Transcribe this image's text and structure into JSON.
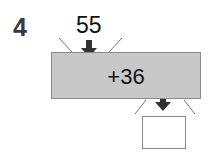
{
  "problem": {
    "number": "4",
    "input_value": "55",
    "operation": "+36",
    "answer": ""
  },
  "colors": {
    "box_fill": "#c8c8c8",
    "box_border": "#8a8a8a",
    "arrow": "#333333",
    "text": "#111111"
  }
}
